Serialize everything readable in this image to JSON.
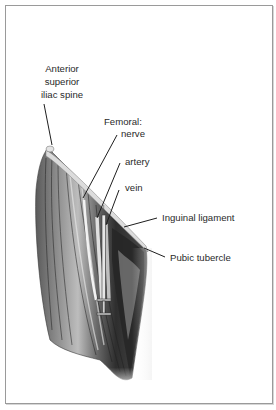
{
  "figure": {
    "labels": {
      "asis": [
        "Anterior",
        "superior",
        "iliac spine"
      ],
      "femoral_heading": "Femoral:",
      "nerve": "nerve",
      "artery": "artery",
      "vein": "vein",
      "inguinal_ligament": "Inguinal ligament",
      "pubic_tubercle": "Pubic tubercle"
    },
    "colors": {
      "border": "#9a9a9a",
      "text": "#2a2a2a",
      "leader": "#1e1e1e",
      "muscle_dark": "#2b2b2b",
      "muscle_mid": "#6e6e6e",
      "muscle_light": "#c9c9c9",
      "ligament": "#d8d8d8"
    }
  }
}
